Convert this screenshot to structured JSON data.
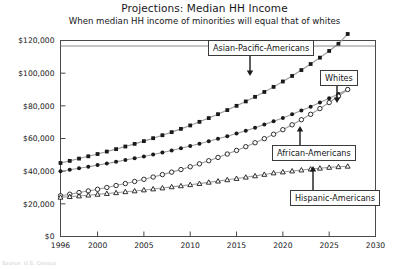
{
  "header": {
    "title": "Projections: Median HH Income",
    "subtitle": "When median HH income of minorities will equal that of whites"
  },
  "annotations": {
    "asian": "Asian-Pacific-Americans",
    "whites": "Whites",
    "african": "African-Americans",
    "hispanic": "Hispanic-Americans"
  },
  "footer": {
    "caption": "Source: U.S. Census"
  },
  "chart_data": {
    "type": "line",
    "title": "Projections: Median HH Income",
    "subtitle": "When median HH income of minorities will equal that of whites",
    "xlabel": "",
    "ylabel": "",
    "xlim": [
      1996,
      2030
    ],
    "ylim": [
      0,
      120000
    ],
    "xticks": [
      1996,
      2000,
      2005,
      2010,
      2015,
      2020,
      2025,
      2030
    ],
    "xtick_labels": [
      "1996",
      "2000",
      "2005",
      "2010",
      "2015",
      "2020",
      "2025",
      "2030"
    ],
    "yticks": [
      0,
      20000,
      40000,
      60000,
      80000,
      100000,
      120000
    ],
    "ytick_labels": [
      "$0",
      "$20,000",
      "$40,000",
      "$60,000",
      "$80,000",
      "$100,000",
      "$120,000"
    ],
    "grid": false,
    "legend": "annotated-callouts",
    "x": [
      1996,
      1997,
      1998,
      1999,
      2000,
      2001,
      2002,
      2003,
      2004,
      2005,
      2006,
      2007,
      2008,
      2009,
      2010,
      2011,
      2012,
      2013,
      2014,
      2015,
      2016,
      2017,
      2018,
      2019,
      2020,
      2021,
      2022,
      2023,
      2024,
      2025,
      2026,
      2027
    ],
    "series": [
      {
        "name": "Asian-Pacific-Americans",
        "marker": "filled-square",
        "color": "#1a1a1a",
        "values": [
          45000,
          46300,
          47700,
          49100,
          50500,
          52000,
          53500,
          55100,
          56700,
          58400,
          60200,
          62000,
          63900,
          65900,
          68000,
          70200,
          72500,
          74900,
          77400,
          80000,
          82700,
          85500,
          88500,
          91600,
          94900,
          98300,
          101900,
          105600,
          109500,
          113600,
          118000,
          124000
        ]
      },
      {
        "name": "Whites",
        "marker": "filled-circle",
        "color": "#1a1a1a",
        "values": [
          40000,
          40900,
          41800,
          42700,
          43700,
          44700,
          45700,
          46800,
          47900,
          49000,
          50200,
          51400,
          52700,
          54000,
          55400,
          56800,
          58300,
          59800,
          61400,
          63100,
          64800,
          66600,
          68500,
          70500,
          72600,
          74800,
          77100,
          79500,
          82000,
          84600,
          87300,
          90200
        ]
      },
      {
        "name": "African-Americans",
        "marker": "open-circle",
        "color": "#1a1a1a",
        "values": [
          25000,
          25900,
          26900,
          27900,
          28900,
          30000,
          31200,
          32400,
          33700,
          35000,
          36400,
          37900,
          39400,
          41000,
          42700,
          44500,
          46400,
          48400,
          50500,
          52700,
          55000,
          57400,
          59900,
          62600,
          65400,
          68400,
          71500,
          74800,
          78300,
          82000,
          85900,
          90000
        ]
      },
      {
        "name": "Hispanic-Americans",
        "marker": "open-triangle",
        "color": "#1a1a1a",
        "values": [
          24000,
          24400,
          24800,
          25300,
          25800,
          26300,
          26800,
          27400,
          27900,
          28500,
          29100,
          29700,
          30400,
          31000,
          31700,
          32400,
          33200,
          33900,
          34700,
          35500,
          36300,
          37100,
          38000,
          38900,
          39500,
          40100,
          40700,
          41300,
          41800,
          42300,
          42700,
          43000
        ]
      }
    ]
  }
}
